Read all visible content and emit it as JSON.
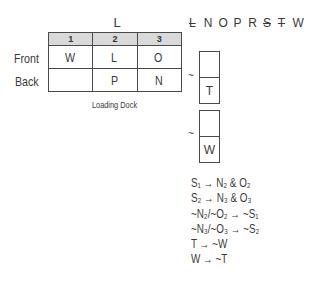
{
  "diagram": {
    "top_label": "L",
    "columns": [
      "1",
      "2",
      "3"
    ],
    "rows": [
      {
        "label": "Front",
        "cells": [
          "W",
          "L",
          "O"
        ]
      },
      {
        "label": "Back",
        "cells": [
          "",
          "P",
          "N"
        ]
      }
    ],
    "bottom_label": "Loading Dock"
  },
  "roster": [
    {
      "letter": "L",
      "struck": true
    },
    {
      "letter": "N",
      "struck": false
    },
    {
      "letter": "O",
      "struck": false
    },
    {
      "letter": "P",
      "struck": false
    },
    {
      "letter": "R",
      "struck": false
    },
    {
      "letter": "S",
      "struck": true
    },
    {
      "letter": "T",
      "struck": true
    },
    {
      "letter": "W",
      "struck": false
    }
  ],
  "mini_boxes": [
    {
      "tilde": "~",
      "top": "",
      "bottom": "T"
    },
    {
      "tilde": "~",
      "top": "",
      "bottom": "W"
    }
  ],
  "rules": [
    "S₁ → N₂ & O₂",
    "S₂ → N₃ & O₃",
    "~N₂/~O₂ → ~S₁",
    "~N₃/~O₃ → ~S₂",
    "T → ~W",
    "W → ~T"
  ]
}
